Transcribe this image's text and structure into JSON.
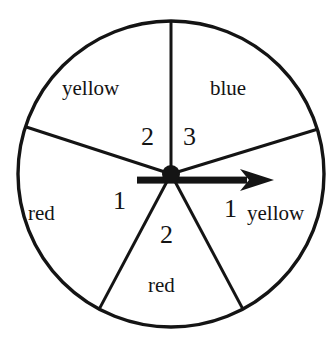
{
  "figure": {
    "kind": "spinner-wheel",
    "background_color": "#ffffff",
    "stroke_color": "#141414",
    "geometry": {
      "center_x": 171,
      "center_y": 174,
      "radius": 153,
      "circle_stroke_width": 3.4,
      "spoke_stroke_width": 3.0,
      "hub_radius": 9,
      "spoke_angles_deg": [
        90,
        162,
        17,
        242,
        298
      ]
    },
    "pointer": {
      "name": "spinner-arrow",
      "direction": "right",
      "angle_deg": 0,
      "tail_x": 137,
      "tip_x": 274,
      "y": 180,
      "shaft_thickness": 7,
      "head_length": 34,
      "head_half_width": 11
    }
  },
  "sectors": [
    {
      "id": "upper-left",
      "color_label": "yellow",
      "count_label": "2",
      "start_angle_deg": 90,
      "end_angle_deg": 162
    },
    {
      "id": "upper-right",
      "color_label": "blue",
      "count_label": "3",
      "start_angle_deg": 17,
      "end_angle_deg": 90
    },
    {
      "id": "left",
      "color_label": "red",
      "count_label": "1",
      "start_angle_deg": 162,
      "end_angle_deg": 242
    },
    {
      "id": "bottom",
      "color_label": "red",
      "count_label": "2",
      "start_angle_deg": 242,
      "end_angle_deg": 298
    },
    {
      "id": "right",
      "color_label": "yellow",
      "count_label": "1",
      "start_angle_deg": 298,
      "end_angle_deg": 17
    }
  ]
}
